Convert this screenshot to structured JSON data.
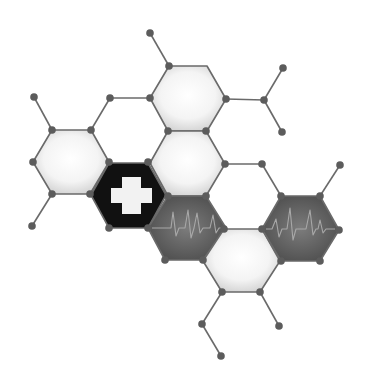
{
  "illustration": {
    "title": "Medical hexagon network",
    "colors": {
      "background": "#ffffff",
      "bond": "#6a6a6a",
      "node": "#5c5c5c",
      "light_hex_center": "#ffffff",
      "light_hex_edge": "#d4d4d4",
      "dark_hex": "#111111",
      "cross": "#f2f2f2",
      "ecg_hex_center": "#7a7a7a",
      "ecg_hex_edge": "#4e4e4e",
      "ecg_line": "#a8a8a8"
    },
    "hexagons": [
      {
        "id": "top",
        "style": "light",
        "points": "169,66 207,66 226,99 207,131 168,131 150,98"
      },
      {
        "id": "left",
        "style": "light",
        "points": "52,130 91,130 109,162 90,194 52,194 33,162"
      },
      {
        "id": "middle",
        "style": "light",
        "points": "168,131 206,131 225,164 206,196 168,196 150,163"
      },
      {
        "id": "cross",
        "style": "dark",
        "icon": "medical-cross",
        "points": "109,163 148,163 166,195 148,228 109,228 91,195"
      },
      {
        "id": "ecg-left",
        "style": "ecg",
        "icon": "heartbeat",
        "points": "168,196 206,196 226,228 203,260 165,260 148,228"
      },
      {
        "id": "bottom",
        "style": "light",
        "points": "224,229 262,229 280,261 260,292 222,292 203,261"
      },
      {
        "id": "ecg-right",
        "style": "ecg",
        "icon": "heartbeat",
        "points": "281,196 320,196 339,230 320,261 281,261 262,229"
      }
    ],
    "bonds": [
      [
        150,
        33,
        169,
        66
      ],
      [
        110,
        98,
        149,
        98
      ],
      [
        110,
        98,
        91,
        130
      ],
      [
        34,
        97,
        52,
        130
      ],
      [
        52,
        194,
        32,
        226
      ],
      [
        226,
        99,
        264,
        100
      ],
      [
        264,
        100,
        283,
        68
      ],
      [
        264,
        100,
        282,
        132
      ],
      [
        225,
        164,
        262,
        164
      ],
      [
        262,
        164,
        281,
        196
      ],
      [
        320,
        196,
        340,
        165
      ],
      [
        222,
        292,
        202,
        324
      ],
      [
        202,
        324,
        221,
        356
      ],
      [
        260,
        292,
        279,
        326
      ]
    ],
    "nodes": [
      [
        150,
        33
      ],
      [
        169,
        66
      ],
      [
        150,
        98
      ],
      [
        110,
        98
      ],
      [
        226,
        99
      ],
      [
        264,
        100
      ],
      [
        283,
        68
      ],
      [
        282,
        132
      ],
      [
        34,
        97
      ],
      [
        52,
        130
      ],
      [
        91,
        130
      ],
      [
        33,
        162
      ],
      [
        109,
        162
      ],
      [
        52,
        194
      ],
      [
        90,
        194
      ],
      [
        32,
        226
      ],
      [
        148,
        162
      ],
      [
        168,
        131
      ],
      [
        206,
        131
      ],
      [
        225,
        164
      ],
      [
        262,
        164
      ],
      [
        340,
        165
      ],
      [
        168,
        196
      ],
      [
        206,
        196
      ],
      [
        109,
        228
      ],
      [
        148,
        228
      ],
      [
        165,
        260
      ],
      [
        203,
        260
      ],
      [
        281,
        196
      ],
      [
        320,
        196
      ],
      [
        262,
        229
      ],
      [
        339,
        230
      ],
      [
        224,
        229
      ],
      [
        281,
        261
      ],
      [
        320,
        261
      ],
      [
        222,
        292
      ],
      [
        260,
        292
      ],
      [
        202,
        324
      ],
      [
        221,
        356
      ],
      [
        279,
        326
      ]
    ],
    "cross": {
      "hbar": {
        "x": 111,
        "y": 188,
        "w": 41,
        "h": 15
      },
      "vbar": {
        "x": 122,
        "y": 177,
        "w": 19,
        "h": 37
      }
    },
    "ecg_traces": {
      "left": "152,228 168,228 171,228 173,212 176,236 179,228 185,228 188,210 191,238 194,228 197,213 200,233 203,228 210,228 213,215 216,233 219,228 222,228",
      "right": "266,229 272,229 276,219 279,237 282,229 287,229 290,208 293,240 296,229 306,229 310,210 313,235 316,229 318,229 320,220 323,233 326,229 335,229"
    }
  }
}
